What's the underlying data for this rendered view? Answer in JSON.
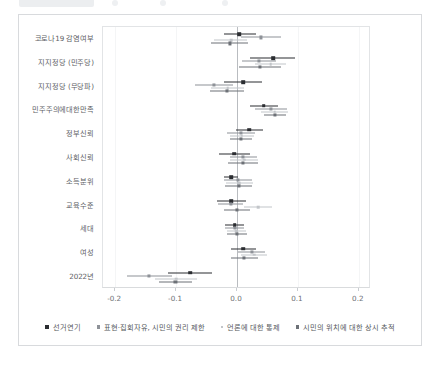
{
  "chart_data": {
    "type": "scatter",
    "title": "",
    "subtitle": "",
    "xlabel": "",
    "ylabel": "",
    "xlim": [
      -0.22,
      0.22
    ],
    "xticks": [
      -0.2,
      -0.1,
      0.0,
      0.1,
      0.2
    ],
    "xticklabels": [
      "-0.2",
      "-0.1",
      "0.0",
      "0.1",
      "0.2"
    ],
    "grid": "vertical-faint",
    "zero_reference_line": 0.0,
    "legend_position": "bottom",
    "categories": [
      "코로나19 감염여부",
      "지지정당 (민주당)",
      "지지정당 (무당파)",
      "민주주의에대한만족",
      "정부신뢰",
      "사회신뢰",
      "소득분위",
      "교육수준",
      "세대",
      "여성",
      "2022년"
    ],
    "series": [
      {
        "name": "선거연기",
        "color": "#2b2d31",
        "marker": "square-large",
        "estimates": [
          0.004,
          0.059,
          0.01,
          0.044,
          0.02,
          -0.005,
          -0.01,
          -0.01,
          -0.004,
          0.01,
          -0.077
        ],
        "ci_low": [
          -0.022,
          0.022,
          -0.022,
          0.021,
          -0.001,
          -0.03,
          -0.022,
          -0.033,
          -0.019,
          -0.01,
          -0.113
        ],
        "ci_high": [
          0.031,
          0.095,
          0.041,
          0.068,
          0.043,
          0.021,
          0.001,
          0.014,
          0.011,
          0.031,
          -0.041
        ]
      },
      {
        "name": "표현·집회자유, 시민의 권리 제한",
        "color": "#8e9298",
        "marker": "square-mid",
        "estimates": [
          0.04,
          0.036,
          -0.038,
          0.056,
          0.007,
          0.01,
          0.002,
          -0.01,
          -0.004,
          0.024,
          -0.144
        ],
        "ci_low": [
          0.007,
          0.008,
          -0.069,
          0.03,
          -0.016,
          -0.012,
          -0.021,
          -0.031,
          -0.019,
          0.002,
          -0.181
        ],
        "ci_high": [
          0.073,
          0.064,
          -0.007,
          0.082,
          0.03,
          0.033,
          0.025,
          0.01,
          0.011,
          0.046,
          -0.107
        ]
      },
      {
        "name": "언론에 대한 통제",
        "color": "#c2c5c9",
        "marker": "square-small",
        "estimates": [
          -0.01,
          0.055,
          -0.015,
          0.062,
          0.008,
          0.012,
          0.004,
          0.035,
          -0.001,
          0.028,
          -0.1
        ],
        "ci_low": [
          -0.037,
          0.03,
          -0.042,
          0.04,
          -0.012,
          -0.011,
          -0.018,
          0.012,
          -0.017,
          0.006,
          -0.134
        ],
        "ci_high": [
          0.017,
          0.08,
          0.012,
          0.084,
          0.028,
          0.035,
          0.026,
          0.058,
          0.015,
          0.05,
          -0.066
        ]
      },
      {
        "name": "시민의 위치에 대한 상시 추적",
        "color": "#6d7177",
        "marker": "square-mid",
        "estimates": [
          -0.012,
          0.038,
          -0.016,
          0.062,
          0.006,
          0.01,
          0.003,
          0.0,
          0.0,
          0.012,
          -0.101
        ],
        "ci_low": [
          -0.042,
          0.004,
          -0.044,
          0.044,
          -0.012,
          -0.014,
          -0.019,
          -0.022,
          -0.016,
          -0.01,
          -0.128
        ],
        "ci_high": [
          0.018,
          0.072,
          0.012,
          0.08,
          0.024,
          0.034,
          0.025,
          0.022,
          0.016,
          0.034,
          -0.074
        ]
      }
    ]
  },
  "legend": {
    "items": [
      {
        "label": "선거연기",
        "marker": "m0"
      },
      {
        "label": "표현·집회자유, 시민의 권리 제한",
        "marker": "m1"
      },
      {
        "label": "언론에 대한 통제",
        "marker": "m2"
      },
      {
        "label": "시민의 위치에 대한 상시 추적",
        "marker": "m3"
      }
    ]
  }
}
